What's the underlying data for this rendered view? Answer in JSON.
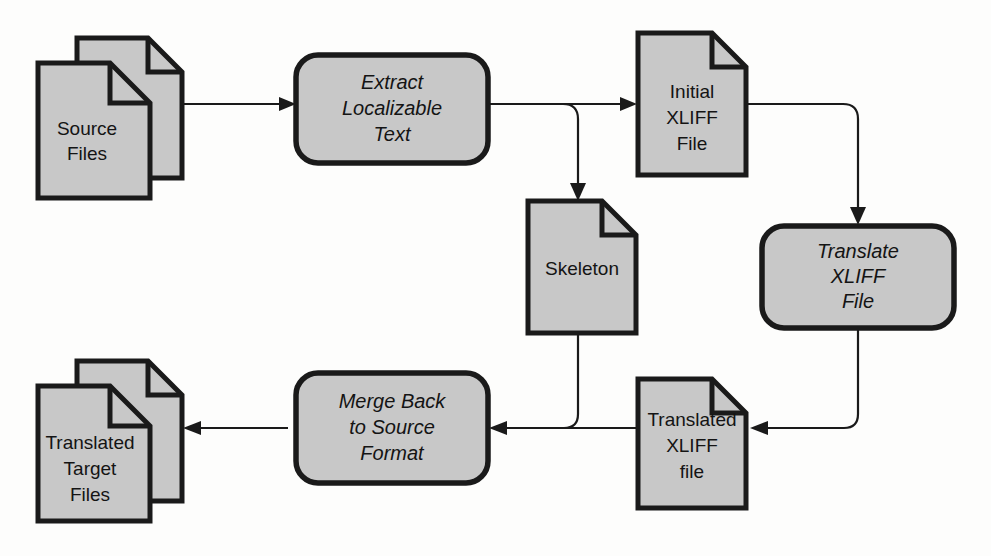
{
  "diagram": {
    "colors": {
      "node_fill": "#c8c8c8",
      "node_stroke": "#1a1a1a",
      "connector": "#1a1a1a",
      "background": "#fdfdfc"
    },
    "nodes": [
      {
        "id": "source-files",
        "kind": "document-stack",
        "lines": [
          "Source",
          "Files"
        ],
        "style": "upright"
      },
      {
        "id": "extract-localizable-text",
        "kind": "process",
        "lines": [
          "Extract",
          "Localizable",
          "Text"
        ],
        "style": "italic"
      },
      {
        "id": "initial-xliff-file",
        "kind": "document",
        "lines": [
          "Initial",
          "XLIFF",
          "File"
        ],
        "style": "upright"
      },
      {
        "id": "skeleton",
        "kind": "document",
        "lines": [
          "Skeleton"
        ],
        "style": "upright"
      },
      {
        "id": "translate-xliff-file",
        "kind": "process",
        "lines": [
          "Translate",
          "XLIFF",
          "File"
        ],
        "style": "italic"
      },
      {
        "id": "translated-xliff-file",
        "kind": "document",
        "lines": [
          "Translated",
          "XLIFF",
          "file"
        ],
        "style": "upright"
      },
      {
        "id": "merge-back-to-source-format",
        "kind": "process",
        "lines": [
          "Merge Back",
          "to Source",
          "Format"
        ],
        "style": "italic"
      },
      {
        "id": "translated-target-files",
        "kind": "document-stack",
        "lines": [
          "Translated",
          "Target",
          "Files"
        ],
        "style": "upright"
      }
    ],
    "edges": [
      {
        "id": "source-to-extract",
        "from": "source-files",
        "to": "extract-localizable-text",
        "arrow": true
      },
      {
        "id": "extract-to-initial-xliff",
        "from": "extract-localizable-text",
        "to": "initial-xliff-file",
        "arrow": true
      },
      {
        "id": "extract-to-skeleton",
        "from": "extract-localizable-text",
        "to": "skeleton",
        "arrow": true
      },
      {
        "id": "initial-xliff-to-translate",
        "from": "initial-xliff-file",
        "to": "translate-xliff-file",
        "arrow": true
      },
      {
        "id": "translate-to-translated-xliff",
        "from": "translate-xliff-file",
        "to": "translated-xliff-file",
        "arrow": true
      },
      {
        "id": "translated-xliff-to-merge",
        "from": "translated-xliff-file",
        "to": "merge-back-to-source-format",
        "arrow": true
      },
      {
        "id": "skeleton-to-merge",
        "from": "skeleton",
        "to": "merge-back-to-source-format",
        "arrow": false
      },
      {
        "id": "merge-to-translated-target",
        "from": "merge-back-to-source-format",
        "to": "translated-target-files",
        "arrow": true
      }
    ]
  }
}
